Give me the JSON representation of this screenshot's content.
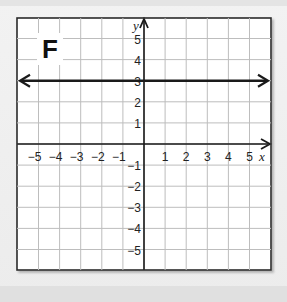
{
  "panel": {
    "label": "F"
  },
  "chart_data": {
    "type": "line",
    "title": "F",
    "xlabel": "x",
    "ylabel": "y",
    "xlim": [
      -6,
      6
    ],
    "ylim": [
      -6,
      6
    ],
    "grid": true,
    "x_ticks": [
      -5,
      -4,
      -3,
      -2,
      -1,
      1,
      2,
      3,
      4,
      5
    ],
    "y_ticks": [
      -5,
      -4,
      -3,
      -2,
      -1,
      1,
      2,
      3,
      4,
      5
    ],
    "x_tick_labels": [
      "−5",
      "−4",
      "−3",
      "−2",
      "−1",
      "1",
      "2",
      "3",
      "4",
      "5"
    ],
    "y_tick_labels": [
      "−5",
      "−4",
      "−3",
      "−2",
      "−1",
      "1",
      "2",
      "3",
      "4",
      "5"
    ],
    "series": [
      {
        "name": "y = 3",
        "equation": "y = 3",
        "x": [
          -6,
          6
        ],
        "y": [
          3,
          3
        ],
        "arrows": "both"
      }
    ]
  },
  "colors": {
    "grid": "#bdbdbd",
    "axis": "#1a1a1a",
    "line": "#1a1a1a",
    "border": "#2a2a2a",
    "plot_bg": "#ffffff"
  }
}
